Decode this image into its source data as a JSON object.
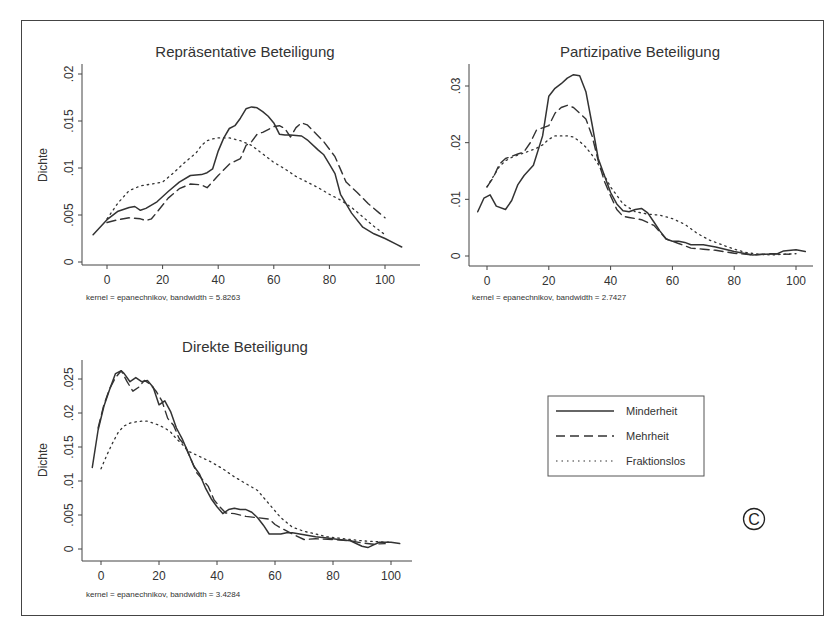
{
  "figure": {
    "copyright_symbol": "©",
    "legend": {
      "items": [
        {
          "label": "Minderheit",
          "style": "solid"
        },
        {
          "label": "Mehrheit",
          "style": "dashed"
        },
        {
          "label": "Fraktionslos",
          "style": "dotted"
        }
      ]
    }
  },
  "chart_data": [
    {
      "type": "line",
      "title": "Repräsentative Beteiligung",
      "xlabel": "",
      "ylabel": "Dichte",
      "note": "kernel = epanechnikov, bandwidth = 5.8263",
      "xticks": [
        0,
        20,
        40,
        60,
        80,
        100
      ],
      "yticks": [
        0,
        0.005,
        0.01,
        0.015,
        0.02
      ],
      "ytick_labels": [
        "0",
        ".005",
        ".01",
        ".015",
        ".02"
      ],
      "xlim": [
        -6,
        113
      ],
      "ylim": [
        0,
        0.021
      ],
      "grid": false,
      "series": [
        {
          "name": "Minderheit",
          "style": "solid",
          "x": [
            -5,
            0,
            4,
            8,
            10,
            12,
            14,
            18,
            22,
            26,
            30,
            34,
            36,
            38,
            40,
            42,
            44,
            46,
            48,
            50,
            52,
            54,
            56,
            58,
            60,
            62,
            64,
            66,
            70,
            72,
            76,
            78,
            80,
            82,
            84,
            88,
            92,
            96,
            100,
            104,
            106
          ],
          "y": [
            0.0029,
            0.0045,
            0.0054,
            0.0058,
            0.0059,
            0.0055,
            0.0057,
            0.0064,
            0.0075,
            0.0085,
            0.0092,
            0.0093,
            0.0095,
            0.0099,
            0.0118,
            0.0132,
            0.0142,
            0.0145,
            0.0153,
            0.0163,
            0.0165,
            0.0164,
            0.016,
            0.0155,
            0.0148,
            0.0136,
            0.0135,
            0.0135,
            0.0134,
            0.013,
            0.0119,
            0.0114,
            0.0104,
            0.0094,
            0.0072,
            0.0052,
            0.0037,
            0.003,
            0.0025,
            0.0019,
            0.0016
          ]
        },
        {
          "name": "Mehrheit",
          "style": "dashed",
          "x": [
            0,
            4,
            8,
            12,
            14,
            16,
            18,
            22,
            26,
            30,
            34,
            36,
            40,
            44,
            48,
            50,
            52,
            54,
            56,
            60,
            62,
            64,
            66,
            68,
            70,
            72,
            74,
            78,
            82,
            86,
            90,
            94,
            98,
            100
          ],
          "y": [
            0.0042,
            0.0045,
            0.0047,
            0.0046,
            0.0044,
            0.0046,
            0.0053,
            0.0068,
            0.0078,
            0.0083,
            0.0082,
            0.0079,
            0.0092,
            0.0104,
            0.011,
            0.0124,
            0.0128,
            0.0136,
            0.0138,
            0.0144,
            0.0145,
            0.0142,
            0.0133,
            0.0143,
            0.0148,
            0.0146,
            0.014,
            0.0128,
            0.0112,
            0.0085,
            0.0074,
            0.0062,
            0.0052,
            0.0047
          ]
        },
        {
          "name": "Fraktionslos",
          "style": "dotted",
          "x": [
            0,
            4,
            8,
            12,
            16,
            20,
            24,
            28,
            32,
            34,
            36,
            38,
            40,
            44,
            48,
            52,
            56,
            60,
            64,
            68,
            72,
            76,
            80,
            84,
            88,
            92,
            96,
            100
          ],
          "y": [
            0.0046,
            0.0063,
            0.0076,
            0.0081,
            0.0083,
            0.0085,
            0.0095,
            0.0106,
            0.0116,
            0.0124,
            0.0129,
            0.0131,
            0.0132,
            0.0132,
            0.0129,
            0.0124,
            0.0115,
            0.0106,
            0.0099,
            0.0091,
            0.0085,
            0.0079,
            0.0072,
            0.0066,
            0.0058,
            0.0048,
            0.0038,
            0.0029
          ]
        }
      ]
    },
    {
      "type": "line",
      "title": "Partizipative Beteiligung",
      "xlabel": "",
      "ylabel": "",
      "note": "kernel = epanechnikov, bandwidth = 2.7427",
      "xticks": [
        0,
        20,
        40,
        60,
        80,
        100
      ],
      "yticks": [
        0,
        0.01,
        0.02,
        0.03
      ],
      "ytick_labels": [
        "0",
        ".01",
        ".02",
        ".03"
      ],
      "xlim": [
        -6,
        107
      ],
      "ylim": [
        0,
        0.033
      ],
      "grid": false,
      "series": [
        {
          "name": "Minderheit",
          "style": "solid",
          "x": [
            -3,
            -1,
            1,
            3,
            6,
            8,
            10,
            12,
            15,
            18,
            20,
            22,
            24,
            26,
            28,
            30,
            32,
            34,
            36,
            38,
            40,
            42,
            44,
            46,
            48,
            50,
            52,
            54,
            56,
            58,
            60,
            62,
            64,
            66,
            70,
            74,
            80,
            86,
            90,
            94,
            96,
            100,
            103
          ],
          "y": [
            0.0078,
            0.0102,
            0.0108,
            0.0088,
            0.0082,
            0.0098,
            0.0126,
            0.0142,
            0.016,
            0.0212,
            0.0282,
            0.0296,
            0.0304,
            0.0314,
            0.032,
            0.0318,
            0.029,
            0.0232,
            0.0172,
            0.0142,
            0.0112,
            0.0092,
            0.008,
            0.0078,
            0.0082,
            0.0084,
            0.0076,
            0.006,
            0.0044,
            0.003,
            0.0026,
            0.0026,
            0.0024,
            0.002,
            0.002,
            0.0016,
            0.0008,
            0.0002,
            0.0003,
            0.0004,
            0.0009,
            0.0011,
            0.0008
          ]
        },
        {
          "name": "Mehrheit",
          "style": "dashed",
          "x": [
            0,
            2,
            4,
            6,
            8,
            10,
            12,
            14,
            16,
            18,
            20,
            22,
            24,
            26,
            28,
            30,
            32,
            34,
            36,
            38,
            40,
            42,
            44,
            46,
            50,
            54,
            58,
            62,
            66,
            70,
            74,
            80,
            86,
            92,
            98
          ],
          "y": [
            0.0122,
            0.0138,
            0.0162,
            0.0172,
            0.0176,
            0.018,
            0.0184,
            0.02,
            0.0222,
            0.0226,
            0.023,
            0.0252,
            0.0262,
            0.0266,
            0.0262,
            0.0252,
            0.0242,
            0.0212,
            0.0168,
            0.0132,
            0.0106,
            0.0082,
            0.007,
            0.0068,
            0.0064,
            0.0054,
            0.003,
            0.0022,
            0.0014,
            0.0012,
            0.001,
            0.0005,
            0.0002,
            0.0004,
            0.0003
          ]
        },
        {
          "name": "Fraktionslos",
          "style": "dotted",
          "x": [
            0,
            2,
            4,
            6,
            8,
            10,
            12,
            14,
            16,
            18,
            20,
            22,
            24,
            26,
            28,
            30,
            32,
            34,
            36,
            38,
            40,
            44,
            48,
            52,
            56,
            60,
            64,
            68,
            72,
            76,
            80,
            84,
            88,
            92,
            96,
            100
          ],
          "y": [
            0.0122,
            0.014,
            0.0158,
            0.0168,
            0.0174,
            0.0178,
            0.0182,
            0.0186,
            0.019,
            0.0196,
            0.0206,
            0.0212,
            0.0212,
            0.0212,
            0.021,
            0.0202,
            0.0192,
            0.0178,
            0.0162,
            0.0142,
            0.0122,
            0.0092,
            0.0078,
            0.0074,
            0.0072,
            0.0066,
            0.0056,
            0.004,
            0.0028,
            0.002,
            0.0012,
            0.0006,
            0.0003,
            0.0002,
            0.0003,
            0.0004
          ]
        }
      ]
    },
    {
      "type": "line",
      "title": "Direkte Beteiligung",
      "xlabel": "",
      "ylabel": "Dichte",
      "note": "kernel = epanechnikov, bandwidth = 3.4284",
      "xticks": [
        0,
        20,
        40,
        60,
        80,
        100
      ],
      "yticks": [
        0,
        0.005,
        0.01,
        0.015,
        0.02,
        0.025
      ],
      "ytick_labels": [
        "0",
        ".005",
        ".01",
        ".015",
        ".02",
        ".025"
      ],
      "xlim": [
        -6,
        108
      ],
      "ylim": [
        0,
        0.0278
      ],
      "grid": false,
      "series": [
        {
          "name": "Minderheit",
          "style": "solid",
          "x": [
            -3,
            -1,
            1,
            3,
            5,
            7,
            8,
            10,
            12,
            14,
            16,
            18,
            20,
            22,
            24,
            26,
            28,
            30,
            32,
            34,
            36,
            38,
            40,
            42,
            44,
            46,
            48,
            50,
            52,
            54,
            56,
            58,
            60,
            62,
            64,
            66,
            70,
            74,
            78,
            82,
            86,
            90,
            92,
            94,
            96,
            100,
            103
          ],
          "y": [
            0.012,
            0.0175,
            0.021,
            0.0235,
            0.0258,
            0.0262,
            0.0258,
            0.0246,
            0.0252,
            0.0246,
            0.0248,
            0.0238,
            0.0212,
            0.0218,
            0.0202,
            0.0178,
            0.0162,
            0.0142,
            0.0122,
            0.011,
            0.009,
            0.0074,
            0.0062,
            0.0052,
            0.0058,
            0.006,
            0.0058,
            0.0058,
            0.0054,
            0.0046,
            0.0035,
            0.0022,
            0.0022,
            0.0022,
            0.0024,
            0.0024,
            0.0021,
            0.0018,
            0.0016,
            0.0014,
            0.0012,
            0.0004,
            0.0002,
            0.0006,
            0.001,
            0.001,
            0.0008
          ]
        },
        {
          "name": "Mehrheit",
          "style": "dashed",
          "x": [
            -1,
            1,
            3,
            5,
            7,
            9,
            11,
            13,
            15,
            17,
            19,
            21,
            23,
            25,
            27,
            29,
            31,
            33,
            35,
            37,
            39,
            41,
            43,
            46,
            50,
            54,
            58,
            60,
            62,
            66,
            70,
            74,
            80,
            86,
            90,
            94,
            98
          ],
          "y": [
            0.0178,
            0.0212,
            0.0236,
            0.0252,
            0.0262,
            0.0246,
            0.0232,
            0.0238,
            0.0248,
            0.0242,
            0.0232,
            0.0218,
            0.0192,
            0.0182,
            0.0162,
            0.0152,
            0.0132,
            0.0112,
            0.0102,
            0.0092,
            0.0072,
            0.0062,
            0.0053,
            0.0052,
            0.0048,
            0.0046,
            0.0044,
            0.0036,
            0.0031,
            0.0022,
            0.0014,
            0.0015,
            0.0014,
            0.0012,
            0.0009,
            0.0007,
            0.0008
          ]
        },
        {
          "name": "Fraktionslos",
          "style": "dotted",
          "x": [
            0,
            2,
            4,
            6,
            8,
            10,
            12,
            14,
            16,
            18,
            20,
            22,
            24,
            26,
            28,
            30,
            34,
            38,
            42,
            46,
            50,
            54,
            58,
            62,
            66,
            70,
            74,
            78,
            82,
            86,
            90,
            94,
            98,
            100
          ],
          "y": [
            0.0118,
            0.0138,
            0.0156,
            0.0172,
            0.0181,
            0.0185,
            0.0187,
            0.0188,
            0.0188,
            0.0185,
            0.0182,
            0.0178,
            0.0172,
            0.0162,
            0.0154,
            0.0144,
            0.0136,
            0.0128,
            0.0118,
            0.0106,
            0.0096,
            0.0086,
            0.0066,
            0.0046,
            0.0032,
            0.0026,
            0.0022,
            0.0018,
            0.0016,
            0.0014,
            0.0012,
            0.0011,
            0.001,
            0.001
          ]
        }
      ]
    }
  ]
}
